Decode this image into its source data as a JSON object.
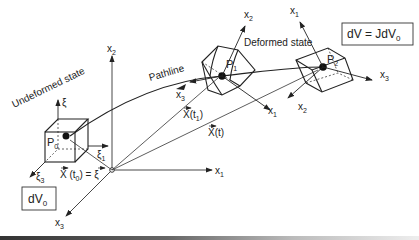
{
  "diagram": {
    "labels": {
      "undeformed_state": "Undeformed state",
      "deformed_state": "Deformed state",
      "pathline": "Pathline",
      "p0": "P",
      "p0_sub": "0",
      "p1": "P",
      "p1_sub": "1",
      "p2": "P",
      "p2_sub": "2",
      "xi": "ξ",
      "xi1": "ξ",
      "xi1_sub": "1",
      "xi3": "ξ",
      "xi3_sub": "3",
      "x_t0": "X (t",
      "x_t0_sub": "0",
      "x_t0_tail": ") = ξ",
      "x_t1": "X(t",
      "x_t1_sub": "1",
      "x_t1_tail": ")",
      "x_t": "X(t)",
      "global_x1": "x",
      "global_x2": "x",
      "global_x3": "x",
      "p1_x1": "x",
      "p1_x2": "x",
      "p1_x3": "x",
      "p2_x1": "x",
      "p2_x2": "x",
      "p2_x3": "x",
      "sub1": "1",
      "sub2": "2",
      "sub3": "3"
    },
    "boxes": {
      "dv0": "dV",
      "dv0_sub": "0",
      "dv": "dV = JdV",
      "dv_sub": "0"
    },
    "colors": {
      "ink": "#222222",
      "background": "#ffffff"
    }
  }
}
